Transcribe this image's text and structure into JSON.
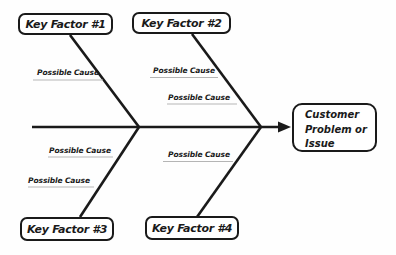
{
  "diagram": {
    "colors": {
      "line": "#1a1a1a",
      "underline": "#b5b5b5",
      "box_border": "#1a1a1a",
      "box_fill": "#ffffff",
      "background": "#fefefe",
      "text": "#1a1a1a"
    },
    "key_factors": [
      {
        "label": "Key Factor #1",
        "position": "top-left"
      },
      {
        "label": "Key Factor #2",
        "position": "top-right"
      },
      {
        "label": "Key Factor #3",
        "position": "bottom-left"
      },
      {
        "label": "Key Factor #4",
        "position": "bottom-right"
      }
    ],
    "possible_causes": [
      {
        "label": "Possible Cause",
        "branch": "top-left"
      },
      {
        "label": "Possible Cause",
        "branch": "top-right-upper"
      },
      {
        "label": "Possible Cause",
        "branch": "top-right-lower"
      },
      {
        "label": "Possible Cause",
        "branch": "bottom-left-upper"
      },
      {
        "label": "Possible Cause",
        "branch": "bottom-left-lower"
      },
      {
        "label": "Possible Cause",
        "branch": "bottom-right"
      }
    ],
    "effect": {
      "label": "Customer Problem or Issue",
      "lines": [
        "Customer",
        "Problem or",
        "Issue"
      ]
    }
  }
}
